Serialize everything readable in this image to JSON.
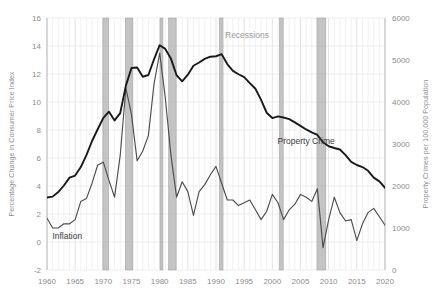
{
  "chart_data": {
    "type": "line",
    "title": "",
    "xlabel": "",
    "ylabel": "Percentage Change in Consumer Price Index",
    "y2label": "Property Crimes per 100,000 Population",
    "xlim": [
      1960,
      2020
    ],
    "ylim": [
      -2,
      16
    ],
    "y2lim": [
      0,
      6000
    ],
    "grid": true,
    "legend_position": "inline-annotation",
    "x_ticks": [
      1960,
      1965,
      1970,
      1975,
      1980,
      1985,
      1990,
      1995,
      2000,
      2005,
      2010,
      2015,
      2020
    ],
    "y_ticks": [
      -2,
      0,
      2,
      4,
      6,
      8,
      10,
      12,
      14,
      16
    ],
    "y2_ticks": [
      0,
      1000,
      2000,
      3000,
      4000,
      5000,
      6000
    ],
    "annotations": [
      {
        "text": "Inflation",
        "x": 1963.6,
        "y": 0.2,
        "series": "inflation"
      },
      {
        "text": "Property Crime",
        "x": 2006.0,
        "y": 3000,
        "series": "property_crime"
      },
      {
        "text": "Recessions",
        "x": 1995.5,
        "y": 14.6,
        "series": "recessions"
      }
    ],
    "series": [
      {
        "name": "Inflation",
        "axis": "left",
        "units": "Percentage Change in Consumer Price Index",
        "color": "#4d4d4d",
        "x": [
          1960,
          1961,
          1962,
          1963,
          1964,
          1965,
          1966,
          1967,
          1968,
          1969,
          1970,
          1971,
          1972,
          1973,
          1974,
          1975,
          1976,
          1977,
          1978,
          1979,
          1980,
          1981,
          1982,
          1983,
          1984,
          1985,
          1986,
          1987,
          1988,
          1989,
          1990,
          1991,
          1992,
          1993,
          1994,
          1995,
          1996,
          1997,
          1998,
          1999,
          2000,
          2001,
          2002,
          2003,
          2004,
          2005,
          2006,
          2007,
          2008,
          2009,
          2010,
          2011,
          2012,
          2013,
          2014,
          2015,
          2016,
          2017,
          2018,
          2019,
          2020
        ],
        "values": [
          1.7,
          1.0,
          1.0,
          1.3,
          1.3,
          1.6,
          2.9,
          3.1,
          4.2,
          5.5,
          5.7,
          4.4,
          3.2,
          6.2,
          11.0,
          9.1,
          5.8,
          6.5,
          7.6,
          11.3,
          13.5,
          10.3,
          6.2,
          3.2,
          4.3,
          3.6,
          1.9,
          3.6,
          4.1,
          4.8,
          5.4,
          4.2,
          3.0,
          3.0,
          2.6,
          2.8,
          3.0,
          2.3,
          1.6,
          2.2,
          3.4,
          2.8,
          1.6,
          2.3,
          2.7,
          3.4,
          3.2,
          2.9,
          3.8,
          -0.4,
          1.6,
          3.2,
          2.1,
          1.5,
          1.6,
          0.1,
          1.3,
          2.1,
          2.4,
          1.8,
          1.2
        ]
      },
      {
        "name": "Property Crime",
        "axis": "right",
        "units": "Property Crimes per 100,000 Population",
        "color": "#1a1a1a",
        "x": [
          1960,
          1961,
          1962,
          1963,
          1964,
          1965,
          1966,
          1967,
          1968,
          1969,
          1970,
          1971,
          1972,
          1973,
          1974,
          1975,
          1976,
          1977,
          1978,
          1979,
          1980,
          1981,
          1982,
          1983,
          1984,
          1985,
          1986,
          1987,
          1988,
          1989,
          1990,
          1991,
          1992,
          1993,
          1994,
          1995,
          1996,
          1997,
          1998,
          1999,
          2000,
          2001,
          2002,
          2003,
          2004,
          2005,
          2006,
          2007,
          2008,
          2009,
          2010,
          2011,
          2012,
          2013,
          2014,
          2015,
          2016,
          2017,
          2018,
          2019,
          2020
        ],
        "values": [
          1726,
          1747,
          1857,
          2012,
          2198,
          2249,
          2451,
          2737,
          3072,
          3351,
          3621,
          3769,
          3561,
          3737,
          4390,
          4811,
          4820,
          4602,
          4643,
          5017,
          5353,
          5264,
          5033,
          4637,
          4492,
          4651,
          4863,
          4940,
          5027,
          5078,
          5089,
          5140,
          4903,
          4740,
          4660,
          4591,
          4451,
          4316,
          4052,
          3744,
          3618,
          3658,
          3631,
          3591,
          3514,
          3432,
          3347,
          3276,
          3215,
          3041,
          2946,
          2905,
          2868,
          2734,
          2574,
          2500,
          2451,
          2362,
          2200,
          2110,
          1958
        ]
      }
    ],
    "recessions": [
      {
        "start": 1969.92,
        "end": 1970.92
      },
      {
        "start": 1973.92,
        "end": 1975.25
      },
      {
        "start": 1980.08,
        "end": 1980.58
      },
      {
        "start": 1981.58,
        "end": 1982.92
      },
      {
        "start": 1990.58,
        "end": 1991.25
      },
      {
        "start": 2001.25,
        "end": 2001.92
      },
      {
        "start": 2007.92,
        "end": 2009.5
      }
    ],
    "colors": {
      "recession_band": "#b3b3b3",
      "gridline": "#e8e8e8",
      "axis_text": "#8c8c8c",
      "inflation_line": "#4d4d4d",
      "property_crime_line": "#1a1a1a",
      "background": "#ffffff"
    }
  }
}
